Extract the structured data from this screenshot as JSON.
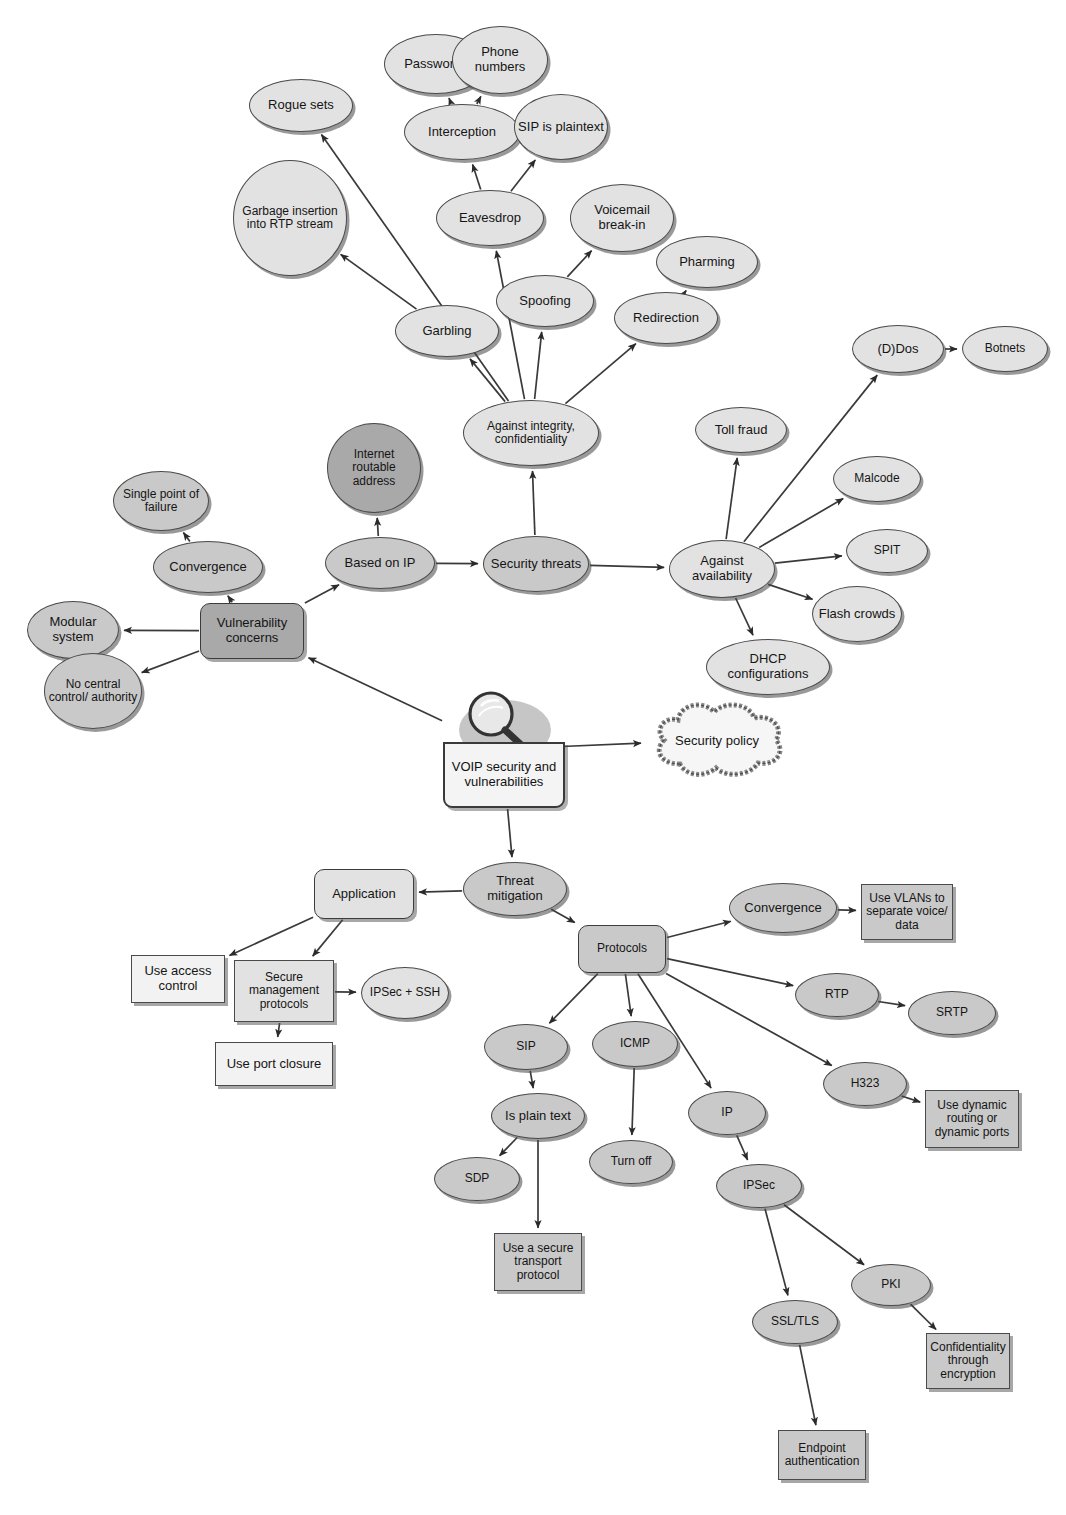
{
  "diagram": {
    "colors": {
      "fill_light": "#e2e2e2",
      "fill_mid": "#c9c9c9",
      "fill_dark": "#a9a9a9",
      "fill_white": "#f4f4f4",
      "stroke": "#4a4a4a",
      "text": "#151515"
    },
    "nodes": [
      {
        "id": "passwords",
        "label": "Passwords",
        "shape": "ellipse",
        "fill": "light",
        "x": 384,
        "y": 34,
        "w": 104,
        "h": 60
      },
      {
        "id": "phone_numbers",
        "label": "Phone numbers",
        "shape": "ellipse",
        "fill": "light",
        "x": 452,
        "y": 26,
        "w": 96,
        "h": 68
      },
      {
        "id": "rogue_sets",
        "label": "Rogue sets",
        "shape": "ellipse",
        "fill": "light",
        "x": 249,
        "y": 79,
        "w": 104,
        "h": 53
      },
      {
        "id": "interception",
        "label": "Interception",
        "shape": "ellipse",
        "fill": "light",
        "x": 404,
        "y": 104,
        "w": 116,
        "h": 56
      },
      {
        "id": "sip_is_plaintext",
        "label": "SIP is plaintext",
        "shape": "ellipse",
        "fill": "light",
        "x": 514,
        "y": 94,
        "w": 94,
        "h": 66
      },
      {
        "id": "garbage_insertion",
        "label": "Garbage insertion into RTP stream",
        "shape": "ellipse",
        "fill": "light",
        "x": 233,
        "y": 160,
        "w": 114,
        "h": 116
      },
      {
        "id": "eavesdrop",
        "label": "Eavesdrop",
        "shape": "ellipse",
        "fill": "light",
        "x": 436,
        "y": 190,
        "w": 108,
        "h": 56
      },
      {
        "id": "voicemail_breakin",
        "label": "Voicemail break-in",
        "shape": "ellipse",
        "fill": "light",
        "x": 570,
        "y": 184,
        "w": 104,
        "h": 68
      },
      {
        "id": "pharming",
        "label": "Pharming",
        "shape": "ellipse",
        "fill": "light",
        "x": 656,
        "y": 236,
        "w": 102,
        "h": 52
      },
      {
        "id": "spoofing",
        "label": "Spoofing",
        "shape": "ellipse",
        "fill": "light",
        "x": 496,
        "y": 275,
        "w": 98,
        "h": 52
      },
      {
        "id": "redirection",
        "label": "Redirection",
        "shape": "ellipse",
        "fill": "light",
        "x": 614,
        "y": 292,
        "w": 104,
        "h": 52
      },
      {
        "id": "garbling",
        "label": "Garbling",
        "shape": "ellipse",
        "fill": "light",
        "x": 395,
        "y": 305,
        "w": 104,
        "h": 52
      },
      {
        "id": "against_integrity",
        "label": "Against integrity, confidentiality",
        "shape": "ellipse",
        "fill": "light",
        "x": 463,
        "y": 400,
        "w": 136,
        "h": 66
      },
      {
        "id": "dos",
        "label": "(D)Dos",
        "shape": "ellipse",
        "fill": "light",
        "x": 852,
        "y": 325,
        "w": 92,
        "h": 48
      },
      {
        "id": "botnets",
        "label": "Botnets",
        "shape": "ellipse",
        "fill": "light",
        "x": 962,
        "y": 326,
        "w": 86,
        "h": 46
      },
      {
        "id": "toll_fraud",
        "label": "Toll fraud",
        "shape": "ellipse",
        "fill": "light",
        "x": 695,
        "y": 407,
        "w": 92,
        "h": 46
      },
      {
        "id": "malcode",
        "label": "Malcode",
        "shape": "ellipse",
        "fill": "light",
        "x": 833,
        "y": 456,
        "w": 88,
        "h": 46
      },
      {
        "id": "spit",
        "label": "SPIT",
        "shape": "ellipse",
        "fill": "light",
        "x": 846,
        "y": 529,
        "w": 82,
        "h": 44
      },
      {
        "id": "flash_crowds",
        "label": "Flash crowds",
        "shape": "ellipse",
        "fill": "light",
        "x": 812,
        "y": 586,
        "w": 90,
        "h": 56
      },
      {
        "id": "dhcp_configs",
        "label": "DHCP configurations",
        "shape": "ellipse",
        "fill": "light",
        "x": 706,
        "y": 639,
        "w": 124,
        "h": 56
      },
      {
        "id": "against_availability",
        "label": "Against availability",
        "shape": "ellipse",
        "fill": "light",
        "x": 669,
        "y": 540,
        "w": 106,
        "h": 58
      },
      {
        "id": "internet_routable",
        "label": "Internet routable address",
        "shape": "ellipse",
        "fill": "dark",
        "x": 327,
        "y": 423,
        "w": 94,
        "h": 90
      },
      {
        "id": "security_threats",
        "label": "Security threats",
        "shape": "ellipse",
        "fill": "mid",
        "x": 483,
        "y": 536,
        "w": 106,
        "h": 56
      },
      {
        "id": "based_on_ip",
        "label": "Based on IP",
        "shape": "ellipse",
        "fill": "mid",
        "x": 325,
        "y": 537,
        "w": 110,
        "h": 52
      },
      {
        "id": "single_point",
        "label": "Single point of failure",
        "shape": "ellipse",
        "fill": "mid",
        "x": 113,
        "y": 471,
        "w": 96,
        "h": 60
      },
      {
        "id": "convergence_v",
        "label": "Convergence",
        "shape": "ellipse",
        "fill": "mid",
        "x": 153,
        "y": 541,
        "w": 110,
        "h": 52
      },
      {
        "id": "modular_system",
        "label": "Modular system",
        "shape": "ellipse",
        "fill": "mid",
        "x": 27,
        "y": 601,
        "w": 92,
        "h": 58
      },
      {
        "id": "no_central_control",
        "label": "No central control/ authority",
        "shape": "ellipse",
        "fill": "mid",
        "x": 44,
        "y": 653,
        "w": 98,
        "h": 76
      },
      {
        "id": "vulnerability_concerns",
        "label": "Vulnerability concerns",
        "shape": "round",
        "fill": "dark",
        "x": 200,
        "y": 603,
        "w": 104,
        "h": 56
      },
      {
        "id": "security_policy",
        "label": "Security policy",
        "shape": "cloud",
        "fill": "white",
        "x": 646,
        "y": 698,
        "w": 142,
        "h": 84
      },
      {
        "id": "voip_central",
        "label": "VOIP security and vulnerabilities",
        "shape": "central",
        "fill": "white",
        "x": 443,
        "y": 690,
        "w": 118,
        "h": 118
      },
      {
        "id": "threat_mitigation",
        "label": "Threat mitigation",
        "shape": "ellipse",
        "fill": "mid",
        "x": 463,
        "y": 862,
        "w": 104,
        "h": 54
      },
      {
        "id": "application",
        "label": "Application",
        "shape": "round",
        "fill": "light",
        "x": 314,
        "y": 869,
        "w": 100,
        "h": 50
      },
      {
        "id": "use_access_control",
        "label": "Use access control",
        "shape": "rect",
        "fill": "white",
        "x": 131,
        "y": 955,
        "w": 94,
        "h": 48
      },
      {
        "id": "secure_mgmt_protocols",
        "label": "Secure management protocols",
        "shape": "rect",
        "fill": "light",
        "x": 234,
        "y": 960,
        "w": 100,
        "h": 62
      },
      {
        "id": "ipsec_ssh",
        "label": "IPSec + SSH",
        "shape": "ellipse",
        "fill": "light",
        "x": 361,
        "y": 967,
        "w": 88,
        "h": 52
      },
      {
        "id": "use_port_closure",
        "label": "Use port closure",
        "shape": "rect",
        "fill": "white",
        "x": 215,
        "y": 1042,
        "w": 118,
        "h": 44
      },
      {
        "id": "protocols",
        "label": "Protocols",
        "shape": "round",
        "fill": "mid",
        "x": 578,
        "y": 925,
        "w": 88,
        "h": 48
      },
      {
        "id": "convergence_p",
        "label": "Convergence",
        "shape": "ellipse",
        "fill": "mid",
        "x": 729,
        "y": 883,
        "w": 108,
        "h": 50
      },
      {
        "id": "use_vlans",
        "label": "Use VLANs to separate voice/ data",
        "shape": "rect",
        "fill": "mid",
        "x": 861,
        "y": 884,
        "w": 92,
        "h": 56
      },
      {
        "id": "rtp",
        "label": "RTP",
        "shape": "ellipse",
        "fill": "mid",
        "x": 795,
        "y": 973,
        "w": 84,
        "h": 44
      },
      {
        "id": "srtp",
        "label": "SRTP",
        "shape": "ellipse",
        "fill": "mid",
        "x": 908,
        "y": 991,
        "w": 88,
        "h": 44
      },
      {
        "id": "sip",
        "label": "SIP",
        "shape": "ellipse",
        "fill": "mid",
        "x": 484,
        "y": 1024,
        "w": 84,
        "h": 46
      },
      {
        "id": "icmp",
        "label": "ICMP",
        "shape": "ellipse",
        "fill": "mid",
        "x": 592,
        "y": 1021,
        "w": 86,
        "h": 46
      },
      {
        "id": "h323",
        "label": "H323",
        "shape": "ellipse",
        "fill": "mid",
        "x": 823,
        "y": 1062,
        "w": 84,
        "h": 44
      },
      {
        "id": "use_dynamic_routing",
        "label": "Use dynamic routing or dynamic ports",
        "shape": "rect",
        "fill": "mid",
        "x": 925,
        "y": 1090,
        "w": 94,
        "h": 58
      },
      {
        "id": "ip",
        "label": "IP",
        "shape": "ellipse",
        "fill": "mid",
        "x": 688,
        "y": 1091,
        "w": 78,
        "h": 44
      },
      {
        "id": "is_plain_text",
        "label": "Is plain text",
        "shape": "ellipse",
        "fill": "mid",
        "x": 491,
        "y": 1093,
        "w": 94,
        "h": 46
      },
      {
        "id": "turn_off",
        "label": "Turn off",
        "shape": "ellipse",
        "fill": "mid",
        "x": 589,
        "y": 1140,
        "w": 84,
        "h": 44
      },
      {
        "id": "sdp",
        "label": "SDP",
        "shape": "ellipse",
        "fill": "mid",
        "x": 434,
        "y": 1157,
        "w": 86,
        "h": 44
      },
      {
        "id": "use_secure_transport",
        "label": "Use a secure transport protocol",
        "shape": "rect",
        "fill": "mid",
        "x": 494,
        "y": 1233,
        "w": 88,
        "h": 58
      },
      {
        "id": "ipsec",
        "label": "IPSec",
        "shape": "ellipse",
        "fill": "mid",
        "x": 716,
        "y": 1164,
        "w": 86,
        "h": 44
      },
      {
        "id": "pki",
        "label": "PKI",
        "shape": "ellipse",
        "fill": "mid",
        "x": 851,
        "y": 1264,
        "w": 80,
        "h": 42
      },
      {
        "id": "ssl_tls",
        "label": "SSL/TLS",
        "shape": "ellipse",
        "fill": "mid",
        "x": 752,
        "y": 1300,
        "w": 86,
        "h": 44
      },
      {
        "id": "confidentiality",
        "label": "Confidentiality through encryption",
        "shape": "rect",
        "fill": "mid",
        "x": 926,
        "y": 1333,
        "w": 84,
        "h": 56
      },
      {
        "id": "endpoint_auth",
        "label": "Endpoint authentication",
        "shape": "rect",
        "fill": "mid",
        "x": 778,
        "y": 1430,
        "w": 88,
        "h": 50
      }
    ],
    "edges": [
      {
        "from": "interception",
        "to": "passwords"
      },
      {
        "from": "interception",
        "to": "phone_numbers"
      },
      {
        "from": "eavesdrop",
        "to": "interception"
      },
      {
        "from": "eavesdrop",
        "to": "sip_is_plaintext"
      },
      {
        "from": "garbling",
        "to": "garbage_insertion"
      },
      {
        "from": "against_integrity",
        "to": "rogue_sets"
      },
      {
        "from": "against_integrity",
        "to": "garbling"
      },
      {
        "from": "against_integrity",
        "to": "eavesdrop"
      },
      {
        "from": "against_integrity",
        "to": "spoofing"
      },
      {
        "from": "against_integrity",
        "to": "redirection"
      },
      {
        "from": "spoofing",
        "to": "voicemail_breakin"
      },
      {
        "from": "redirection",
        "to": "pharming"
      },
      {
        "from": "security_threats",
        "to": "against_integrity"
      },
      {
        "from": "security_threats",
        "to": "against_availability"
      },
      {
        "from": "based_on_ip",
        "to": "security_threats"
      },
      {
        "from": "based_on_ip",
        "to": "internet_routable"
      },
      {
        "from": "vulnerability_concerns",
        "to": "based_on_ip"
      },
      {
        "from": "vulnerability_concerns",
        "to": "convergence_v"
      },
      {
        "from": "vulnerability_concerns",
        "to": "modular_system"
      },
      {
        "from": "vulnerability_concerns",
        "to": "no_central_control"
      },
      {
        "from": "convergence_v",
        "to": "single_point"
      },
      {
        "from": "against_availability",
        "to": "toll_fraud"
      },
      {
        "from": "against_availability",
        "to": "dos"
      },
      {
        "from": "against_availability",
        "to": "malcode"
      },
      {
        "from": "against_availability",
        "to": "spit"
      },
      {
        "from": "against_availability",
        "to": "flash_crowds"
      },
      {
        "from": "against_availability",
        "to": "dhcp_configs"
      },
      {
        "from": "dos",
        "to": "botnets"
      },
      {
        "from": "voip_central",
        "to": "vulnerability_concerns"
      },
      {
        "from": "voip_central",
        "to": "security_policy"
      },
      {
        "from": "voip_central",
        "to": "threat_mitigation"
      },
      {
        "from": "threat_mitigation",
        "to": "application"
      },
      {
        "from": "threat_mitigation",
        "to": "protocols"
      },
      {
        "from": "application",
        "to": "use_access_control"
      },
      {
        "from": "application",
        "to": "secure_mgmt_protocols"
      },
      {
        "from": "secure_mgmt_protocols",
        "to": "ipsec_ssh"
      },
      {
        "from": "secure_mgmt_protocols",
        "to": "use_port_closure"
      },
      {
        "from": "protocols",
        "to": "convergence_p"
      },
      {
        "from": "protocols",
        "to": "rtp"
      },
      {
        "from": "protocols",
        "to": "sip"
      },
      {
        "from": "protocols",
        "to": "icmp"
      },
      {
        "from": "protocols",
        "to": "h323"
      },
      {
        "from": "protocols",
        "to": "ip"
      },
      {
        "from": "convergence_p",
        "to": "use_vlans"
      },
      {
        "from": "rtp",
        "to": "srtp"
      },
      {
        "from": "h323",
        "to": "use_dynamic_routing"
      },
      {
        "from": "sip",
        "to": "is_plain_text"
      },
      {
        "from": "is_plain_text",
        "to": "sdp"
      },
      {
        "from": "is_plain_text",
        "to": "use_secure_transport"
      },
      {
        "from": "icmp",
        "to": "turn_off"
      },
      {
        "from": "ip",
        "to": "ipsec"
      },
      {
        "from": "ipsec",
        "to": "ssl_tls"
      },
      {
        "from": "ipsec",
        "to": "pki"
      },
      {
        "from": "pki",
        "to": "confidentiality"
      },
      {
        "from": "ssl_tls",
        "to": "endpoint_auth"
      }
    ]
  }
}
